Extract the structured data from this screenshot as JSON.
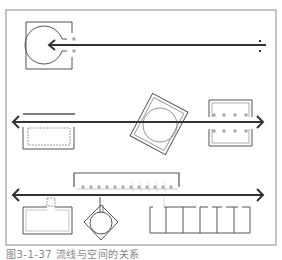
{
  "figure": {
    "caption": "图3-1-37  流线与空间的关系",
    "colors": {
      "frame": "#8a8a8a",
      "line": "#555555",
      "flow_line": "#333333",
      "background": "#ffffff"
    }
  },
  "panels": [
    {
      "id": "top",
      "description": "flow line terminating inside an enclosed circular space",
      "flow_direction": "right-to-left",
      "elements": [
        "square-frame",
        "open-circle-space",
        "flow-arrow",
        "entry-marks"
      ]
    },
    {
      "id": "middle",
      "description": "flow line passing by, through, and between spaces",
      "flow_direction": "bidirectional",
      "elements": [
        "side-space-rect",
        "rotated-square-with-circle",
        "colonnade-space"
      ]
    },
    {
      "id": "bottom",
      "description": "flow line linking a series of spaces via branches",
      "flow_direction": "bidirectional",
      "elements": [
        "corridor-with-dots",
        "rect-space",
        "diamond-with-circle",
        "cell-row"
      ]
    }
  ]
}
